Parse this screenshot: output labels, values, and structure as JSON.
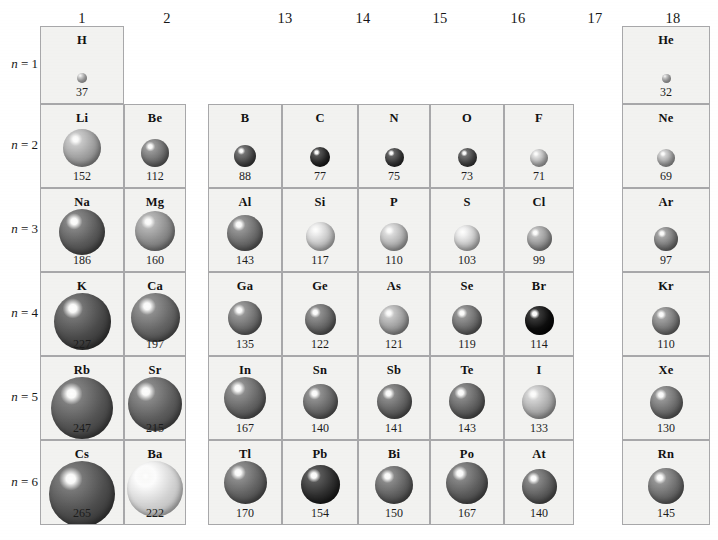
{
  "figure": {
    "cell_fill": "#f2f2f0",
    "cell_border": "#a8a8aa",
    "background": "#ffffff"
  },
  "groups": [
    {
      "label": "1"
    },
    {
      "label": "2"
    },
    {
      "label": "13"
    },
    {
      "label": "14"
    },
    {
      "label": "15"
    },
    {
      "label": "16"
    },
    {
      "label": "17"
    },
    {
      "label": "18"
    }
  ],
  "periods": [
    {
      "label": "n = 1",
      "n": "1"
    },
    {
      "label": "n = 2",
      "n": "2"
    },
    {
      "label": "n = 3",
      "n": "3"
    },
    {
      "label": "n = 4",
      "n": "4"
    },
    {
      "label": "n = 5",
      "n": "5"
    },
    {
      "label": "n = 6",
      "n": "6"
    }
  ],
  "chart_data": {
    "type": "table",
    "xlabel": "Group",
    "ylabel": "Period (n)",
    "categories": [
      "1",
      "2",
      "13",
      "14",
      "15",
      "16",
      "17",
      "18"
    ],
    "row_labels": [
      "n = 1",
      "n = 2",
      "n = 3",
      "n = 4",
      "n = 5",
      "n = 6"
    ],
    "cells": [
      {
        "symbol": "H",
        "value": 37,
        "group": "1",
        "period": "1",
        "diameter_px": 10,
        "shade": "#b9b9b9"
      },
      {
        "symbol": "He",
        "value": 32,
        "group": "18",
        "period": "1",
        "diameter_px": 9,
        "shade": "#b5b5b5"
      },
      {
        "symbol": "Li",
        "value": 152,
        "group": "1",
        "period": "2",
        "diameter_px": 38,
        "shade": "#9d9d9d"
      },
      {
        "symbol": "Be",
        "value": 112,
        "group": "2",
        "period": "2",
        "diameter_px": 28,
        "shade": "#6e6e6e"
      },
      {
        "symbol": "B",
        "value": 88,
        "group": "13",
        "period": "2",
        "diameter_px": 22,
        "shade": "#4a4a4a"
      },
      {
        "symbol": "C",
        "value": 77,
        "group": "14",
        "period": "2",
        "diameter_px": 20,
        "shade": "#2a2a2a"
      },
      {
        "symbol": "N",
        "value": 75,
        "group": "15",
        "period": "2",
        "diameter_px": 19,
        "shade": "#3a3a3a"
      },
      {
        "symbol": "O",
        "value": 73,
        "group": "16",
        "period": "2",
        "diameter_px": 19,
        "shade": "#474747"
      },
      {
        "symbol": "F",
        "value": 71,
        "group": "17",
        "period": "2",
        "diameter_px": 18,
        "shade": "#b4b4b4"
      },
      {
        "symbol": "Ne",
        "value": 69,
        "group": "18",
        "period": "2",
        "diameter_px": 18,
        "shade": "#a6a6a6"
      },
      {
        "symbol": "Na",
        "value": 186,
        "group": "1",
        "period": "3",
        "diameter_px": 46,
        "shade": "#595959"
      },
      {
        "symbol": "Mg",
        "value": 160,
        "group": "2",
        "period": "3",
        "diameter_px": 40,
        "shade": "#8a8a8a"
      },
      {
        "symbol": "Al",
        "value": 143,
        "group": "13",
        "period": "3",
        "diameter_px": 36,
        "shade": "#6a6a6a"
      },
      {
        "symbol": "Si",
        "value": 117,
        "group": "14",
        "period": "3",
        "diameter_px": 29,
        "shade": "#c2c2c2"
      },
      {
        "symbol": "P",
        "value": 110,
        "group": "15",
        "period": "3",
        "diameter_px": 28,
        "shade": "#b0b0b0"
      },
      {
        "symbol": "S",
        "value": 103,
        "group": "16",
        "period": "3",
        "diameter_px": 26,
        "shade": "#c4c4c4"
      },
      {
        "symbol": "Cl",
        "value": 99,
        "group": "17",
        "period": "3",
        "diameter_px": 25,
        "shade": "#939393"
      },
      {
        "symbol": "Ar",
        "value": 97,
        "group": "18",
        "period": "3",
        "diameter_px": 24,
        "shade": "#7a7a7a"
      },
      {
        "symbol": "K",
        "value": 227,
        "group": "1",
        "period": "4",
        "diameter_px": 57,
        "shade": "#4a4a4a"
      },
      {
        "symbol": "Ca",
        "value": 197,
        "group": "2",
        "period": "4",
        "diameter_px": 49,
        "shade": "#646464"
      },
      {
        "symbol": "Ga",
        "value": 135,
        "group": "13",
        "period": "4",
        "diameter_px": 34,
        "shade": "#6d6d6d"
      },
      {
        "symbol": "Ge",
        "value": 122,
        "group": "14",
        "period": "4",
        "diameter_px": 31,
        "shade": "#656565"
      },
      {
        "symbol": "As",
        "value": 121,
        "group": "15",
        "period": "4",
        "diameter_px": 30,
        "shade": "#9b9b9b"
      },
      {
        "symbol": "Se",
        "value": 119,
        "group": "16",
        "period": "4",
        "diameter_px": 30,
        "shade": "#6a6a6a"
      },
      {
        "symbol": "Br",
        "value": 114,
        "group": "17",
        "period": "4",
        "diameter_px": 29,
        "shade": "#0e0e0e"
      },
      {
        "symbol": "Kr",
        "value": 110,
        "group": "18",
        "period": "4",
        "diameter_px": 28,
        "shade": "#777777"
      },
      {
        "symbol": "Rb",
        "value": 247,
        "group": "1",
        "period": "5",
        "diameter_px": 62,
        "shade": "#545454"
      },
      {
        "symbol": "Sr",
        "value": 215,
        "group": "2",
        "period": "5",
        "diameter_px": 54,
        "shade": "#5d5d5d"
      },
      {
        "symbol": "In",
        "value": 167,
        "group": "13",
        "period": "5",
        "diameter_px": 42,
        "shade": "#646464"
      },
      {
        "symbol": "Sn",
        "value": 140,
        "group": "14",
        "period": "5",
        "diameter_px": 35,
        "shade": "#656565"
      },
      {
        "symbol": "Sb",
        "value": 141,
        "group": "15",
        "period": "5",
        "diameter_px": 35,
        "shade": "#606060"
      },
      {
        "symbol": "Te",
        "value": 143,
        "group": "16",
        "period": "5",
        "diameter_px": 36,
        "shade": "#5e5e5e"
      },
      {
        "symbol": "I",
        "value": 133,
        "group": "17",
        "period": "5",
        "diameter_px": 34,
        "shade": "#a9a9a9"
      },
      {
        "symbol": "Xe",
        "value": 130,
        "group": "18",
        "period": "5",
        "diameter_px": 33,
        "shade": "#6b6b6b"
      },
      {
        "symbol": "Cs",
        "value": 265,
        "group": "1",
        "period": "6",
        "diameter_px": 66,
        "shade": "#4e4e4e"
      },
      {
        "symbol": "Ba",
        "value": 222,
        "group": "2",
        "period": "6",
        "diameter_px": 56,
        "shade": "#d2d2d2"
      },
      {
        "symbol": "Tl",
        "value": 170,
        "group": "13",
        "period": "6",
        "diameter_px": 43,
        "shade": "#616161"
      },
      {
        "symbol": "Pb",
        "value": 154,
        "group": "14",
        "period": "6",
        "diameter_px": 39,
        "shade": "#2e2e2e"
      },
      {
        "symbol": "Bi",
        "value": 150,
        "group": "15",
        "period": "6",
        "diameter_px": 38,
        "shade": "#5f5f5f"
      },
      {
        "symbol": "Po",
        "value": 167,
        "group": "16",
        "period": "6",
        "diameter_px": 42,
        "shade": "#5b5b5b"
      },
      {
        "symbol": "At",
        "value": 140,
        "group": "17",
        "period": "6",
        "diameter_px": 35,
        "shade": "#5c5c5c"
      },
      {
        "symbol": "Rn",
        "value": 145,
        "group": "18",
        "period": "6",
        "diameter_px": 36,
        "shade": "#6a6a6a"
      }
    ]
  }
}
